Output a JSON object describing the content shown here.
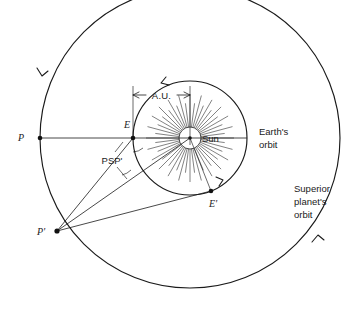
{
  "figure": {
    "type": "astronomy-orbital-diagram",
    "background_color": "#ffffff",
    "line_color": "#1a1a1a"
  },
  "labels": {
    "p": "P",
    "p_prime": "P'",
    "e": "E",
    "e_prime": "E'",
    "sun": "Sun",
    "au": "A.U.",
    "angle": "PSP'",
    "earth_orbit_line1": "Earth's",
    "earth_orbit_line2": "orbit",
    "superior_orbit_line1": "Superior",
    "superior_orbit_line2": "planet's",
    "superior_orbit_line3": "orbit"
  },
  "geometry": {
    "sun_center": {
      "x": 190,
      "y": 138
    },
    "sun_disc_radius": 11,
    "earth_orbit_radius": 57,
    "superior_orbit_radius": 150,
    "points": {
      "P": {
        "x": 40,
        "y": 138
      },
      "E": {
        "x": 133,
        "y": 138
      },
      "E_prime": {
        "x": 211,
        "y": 191
      },
      "P_prime": {
        "x": 57,
        "y": 231
      }
    },
    "au_dimension": {
      "y": 95,
      "x_start": 133,
      "x_end": 190,
      "value_label": "A.U."
    },
    "sun_ray_count": 48
  },
  "annotations": {
    "earth_orbit_direction": "counterclockwise",
    "superior_orbit_direction": "counterclockwise"
  }
}
